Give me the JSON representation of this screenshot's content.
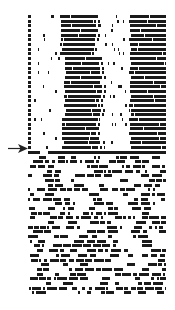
{
  "figure": {
    "marker": {
      "type": "arrow",
      "direction": "right",
      "row_index": 29
    }
  },
  "chart_data": {
    "type": "heatmap",
    "title": "",
    "xlabel": "",
    "ylabel": "",
    "rows": 60,
    "grid": false,
    "legend": null,
    "phases": [
      {
        "name": "ordered",
        "rows": [
          0,
          28
        ],
        "pattern": "two dark vertical bands with sparse dots in light regions",
        "bands": [
          {
            "start_frac": 0.24,
            "end_frac": 0.49,
            "drift": "shifts slightly right mid-section"
          },
          {
            "start_frac": 0.74,
            "end_frac": 1.0
          }
        ]
      },
      {
        "name": "transition",
        "rows": [
          29,
          29
        ],
        "pattern": "mostly dark row at arrow"
      },
      {
        "name": "disordered",
        "rows": [
          30,
          59
        ],
        "pattern": "random short dark dashes, ~50% fill"
      }
    ],
    "colors": {
      "on": "#1a1a1a",
      "off": "#ffffff"
    }
  }
}
